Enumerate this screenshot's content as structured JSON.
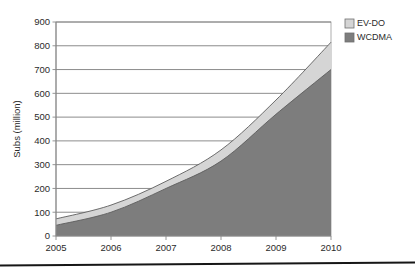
{
  "chart_data": {
    "type": "area",
    "stacked": true,
    "title": "",
    "subtitle": "",
    "xlabel": "",
    "ylabel": "Subs (million)",
    "categories": [
      "2005",
      "2006",
      "2007",
      "2008",
      "2009",
      "2010"
    ],
    "x": [
      2005,
      2006,
      2007,
      2008,
      2009,
      2010
    ],
    "xlim": [
      2005,
      2010
    ],
    "ylim": [
      0,
      900
    ],
    "y_ticks": [
      0,
      100,
      200,
      300,
      400,
      500,
      600,
      700,
      800,
      900
    ],
    "y_tick_labels": [
      "0",
      "100",
      "200",
      "300",
      "400",
      "500",
      "600",
      "700",
      "800",
      "900"
    ],
    "x_tick_labels": [
      "2005",
      "2006",
      "2007",
      "2008",
      "2009",
      "2010"
    ],
    "grid": true,
    "grid_axis": "y",
    "legend_position": "top-right-outside",
    "series": [
      {
        "name": "WCDMA",
        "color": "#7d7d7d",
        "values": [
          45,
          100,
          200,
          315,
          512,
          700
        ],
        "stack_order": 1
      },
      {
        "name": "EV-DO",
        "color": "#d5d5d5",
        "values": [
          27,
          30,
          30,
          47,
          60,
          115
        ],
        "cumulative_top": [
          72,
          130,
          230,
          362,
          572,
          815
        ],
        "stack_order": 2
      }
    ]
  },
  "legend": {
    "items": [
      {
        "label": "EV-DO",
        "color": "#d5d5d5"
      },
      {
        "label": "WCDMA",
        "color": "#7d7d7d"
      }
    ]
  },
  "axes": {
    "y_title": "Subs (million)"
  },
  "colors": {
    "ev_do": "#d5d5d5",
    "wcdma": "#7d7d7d",
    "grid": "#6f6f6f",
    "axis": "#8a8a8a",
    "text": "#2b2b2b",
    "rule": "#161616",
    "background": "#ffffff"
  }
}
